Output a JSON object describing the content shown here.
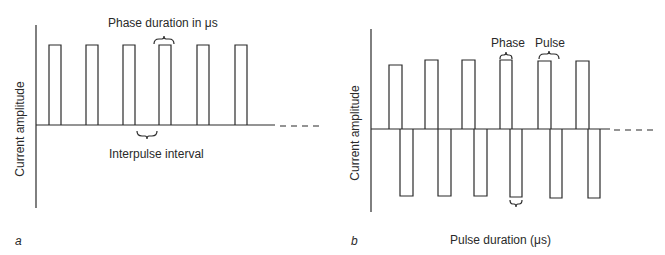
{
  "panel_a": {
    "letter": "a",
    "y_axis_label": "Current amplitude",
    "top_annotation": "Phase duration in μs",
    "bottom_annotation": "Interpulse interval",
    "waveform": "monophasic",
    "pulse_count": 6
  },
  "panel_b": {
    "letter": "b",
    "y_axis_label": "Current amplitude",
    "phase_annotation": "Phase",
    "pulse_annotation": "Pulse",
    "x_axis_label": "Pulse duration (μs)",
    "waveform": "biphasic",
    "pulse_count": 6
  },
  "colors": {
    "line": "#2a2a2a",
    "background": "#ffffff"
  }
}
